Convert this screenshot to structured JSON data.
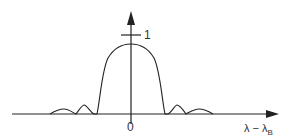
{
  "diagram": {
    "type": "reflection spectrum (Bragg grating)",
    "x_axis": {
      "label": "λ − λ",
      "label_subscript": "B",
      "origin_label": "0"
    },
    "y_axis": {
      "tick_label": "1"
    },
    "colors": {
      "stroke": "#222222",
      "background": "#ffffff"
    },
    "curve": {
      "main_lobe": {
        "peak_x": 131,
        "peak_y": 44,
        "left_zero_x": 97,
        "right_zero_x": 165
      },
      "side_lobes": [
        {
          "position": "left-1",
          "peak_x": 84,
          "peak_y": 105
        },
        {
          "position": "left-2",
          "peak_x": 63,
          "peak_y": 110
        },
        {
          "position": "right-1",
          "peak_x": 177,
          "peak_y": 105
        },
        {
          "position": "right-2",
          "peak_x": 199,
          "peak_y": 110
        }
      ]
    }
  }
}
